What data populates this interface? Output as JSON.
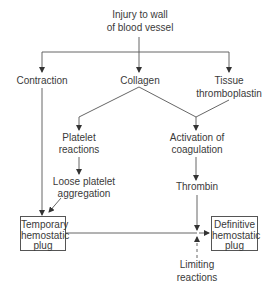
{
  "diagram": {
    "nodes": {
      "injury": {
        "line1": "Injury to wall",
        "line2": "of blood vessel"
      },
      "contraction": {
        "label": "Contraction"
      },
      "collagen": {
        "label": "Collagen"
      },
      "tissue": {
        "line1": "Tissue",
        "line2": "thromboplastin"
      },
      "platelet_reactions": {
        "line1": "Platelet",
        "line2": "reactions"
      },
      "activation": {
        "line1": "Activation of",
        "line2": "coagulation"
      },
      "loose": {
        "line1": "Loose platelet",
        "line2": "aggregation"
      },
      "thrombin": {
        "label": "Thrombin"
      },
      "temporary_plug": {
        "line1": "Temporary",
        "line2": "hemostatic",
        "line3": "plug"
      },
      "definitive_plug": {
        "line1": "Definitive",
        "line2": "hemostatic",
        "line3": "plug"
      },
      "limiting": {
        "line1": "Limiting",
        "line2": "reactions"
      }
    },
    "edges": [
      {
        "from": "injury",
        "to": "contraction",
        "style": "solid"
      },
      {
        "from": "injury",
        "to": "collagen",
        "style": "solid"
      },
      {
        "from": "injury",
        "to": "tissue",
        "style": "solid"
      },
      {
        "from": "collagen",
        "to": "platelet_reactions",
        "style": "solid"
      },
      {
        "from": "collagen",
        "to": "activation",
        "style": "solid"
      },
      {
        "from": "tissue",
        "to": "activation",
        "style": "solid"
      },
      {
        "from": "platelet_reactions",
        "to": "loose",
        "style": "solid"
      },
      {
        "from": "activation",
        "to": "thrombin",
        "style": "solid"
      },
      {
        "from": "contraction",
        "to": "temporary_plug",
        "style": "solid"
      },
      {
        "from": "loose",
        "to": "temporary_plug",
        "style": "solid"
      },
      {
        "from": "temporary_plug",
        "to": "definitive_plug",
        "style": "solid"
      },
      {
        "from": "thrombin",
        "to": "definitive_plug",
        "style": "solid"
      },
      {
        "from": "limiting",
        "to": "definitive_plug",
        "style": "dashed"
      }
    ],
    "colors": {
      "line": "#444444",
      "text": "#3a3a3a",
      "background": "#ffffff"
    }
  }
}
